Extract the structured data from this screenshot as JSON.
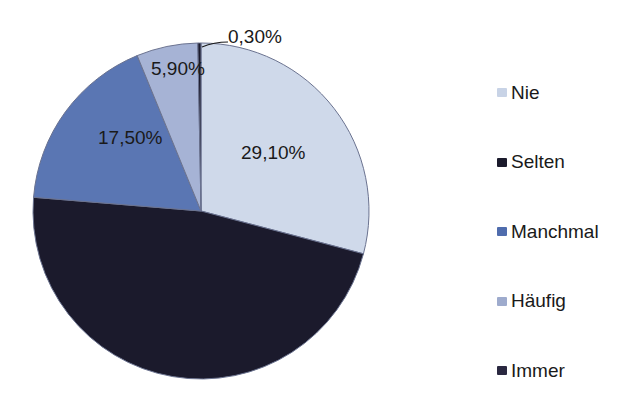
{
  "chart_data": {
    "type": "pie",
    "title": "",
    "categories": [
      "Nie",
      "Selten",
      "Manchmal",
      "Häufig",
      "Immer"
    ],
    "values": [
      29.1,
      47.2,
      17.5,
      5.9,
      0.3
    ],
    "labels": [
      "29,10%",
      "",
      "17,50%",
      "5,90%",
      "0,30%"
    ],
    "colors": [
      "#cfd9ea",
      "#1b1a2c",
      "#5a76b3",
      "#a6b3d5",
      "#1b1a2c"
    ],
    "legend": {
      "position": "right",
      "entries": [
        "Nie",
        "Selten",
        "Manchmal",
        "Häufig",
        "Immer"
      ]
    },
    "start_angle_deg": 0,
    "direction": "clockwise"
  },
  "legend": {
    "items": [
      {
        "label": "Nie",
        "color": "#c8d3e6"
      },
      {
        "label": "Selten",
        "color": "#1b1a2c"
      },
      {
        "label": "Manchmal",
        "color": "#4f6cad"
      },
      {
        "label": "Häufig",
        "color": "#9eabcd"
      },
      {
        "label": "Immer",
        "color": "#2a2840"
      }
    ]
  },
  "slice_labels": {
    "nie": "29,10%",
    "manchmal": "17,50%",
    "haeufig": "5,90%",
    "immer": "0,30%"
  }
}
